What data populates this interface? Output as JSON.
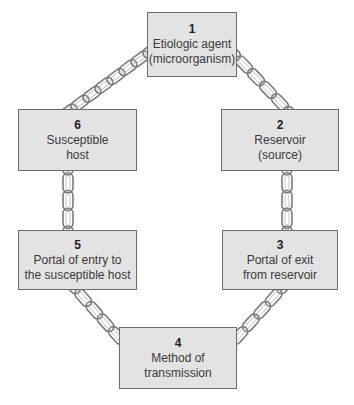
{
  "diagram": {
    "links": [
      {
        "number": "1",
        "lines": [
          "Etiologic agent",
          "(microorganism)"
        ]
      },
      {
        "number": "2",
        "lines": [
          "Reservoir",
          "(source)"
        ]
      },
      {
        "number": "3",
        "lines": [
          "Portal of exit",
          "from reservoir"
        ]
      },
      {
        "number": "4",
        "lines": [
          "Method of",
          "transmission"
        ]
      },
      {
        "number": "5",
        "lines": [
          "Portal of entry to",
          "the susceptible host"
        ]
      },
      {
        "number": "6",
        "lines": [
          "Susceptible",
          "host"
        ]
      }
    ],
    "connections": [
      {
        "from": "1",
        "to": "2"
      },
      {
        "from": "2",
        "to": "3"
      },
      {
        "from": "3",
        "to": "4"
      },
      {
        "from": "4",
        "to": "5"
      },
      {
        "from": "5",
        "to": "6"
      },
      {
        "from": "6",
        "to": "1"
      }
    ],
    "colors": {
      "box_fill": "#e3e3e3",
      "box_border": "#6b6b6b",
      "chain": "#7a7a7a"
    }
  }
}
